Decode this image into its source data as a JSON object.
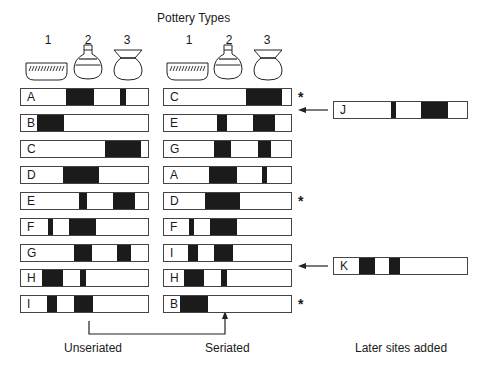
{
  "title": "Pottery Types",
  "pottery_types": [
    {
      "number": "1",
      "shape": "hatched-bowl"
    },
    {
      "number": "2",
      "shape": "narrow-neck-flask"
    },
    {
      "number": "3",
      "shape": "flared-rim-jar"
    }
  ],
  "unseriated": {
    "caption": "Unseriated",
    "bar_range_px": [
      20,
      149
    ],
    "rows": [
      {
        "label": "A",
        "fills": [
          [
            66,
            94
          ],
          [
            120,
            126
          ]
        ],
        "star": false
      },
      {
        "label": "B",
        "fills": [
          [
            37,
            64
          ]
        ],
        "star": false
      },
      {
        "label": "C",
        "fills": [
          [
            105,
            141
          ]
        ],
        "star": false
      },
      {
        "label": "D",
        "fills": [
          [
            63,
            99
          ]
        ],
        "star": false
      },
      {
        "label": "E",
        "fills": [
          [
            79,
            87
          ],
          [
            113,
            135
          ]
        ],
        "star": false
      },
      {
        "label": "F",
        "fills": [
          [
            48,
            53
          ],
          [
            69,
            96
          ]
        ],
        "star": false
      },
      {
        "label": "G",
        "fills": [
          [
            74,
            92
          ],
          [
            117,
            131
          ]
        ],
        "star": false
      },
      {
        "label": "H",
        "fills": [
          [
            42,
            63
          ],
          [
            80,
            86
          ]
        ],
        "star": false
      },
      {
        "label": "I",
        "fills": [
          [
            47,
            57
          ],
          [
            74,
            93
          ]
        ],
        "star": false
      }
    ]
  },
  "seriated": {
    "caption": "Seriated",
    "bar_range_px": [
      163,
      292
    ],
    "rows": [
      {
        "label": "C",
        "fills": [
          [
            246,
            282
          ]
        ],
        "star": true
      },
      {
        "label": "E",
        "fills": [
          [
            217,
            227
          ],
          [
            253,
            275
          ]
        ],
        "star": false
      },
      {
        "label": "G",
        "fills": [
          [
            214,
            231
          ],
          [
            258,
            271
          ]
        ],
        "star": false
      },
      {
        "label": "A",
        "fills": [
          [
            209,
            237
          ],
          [
            262,
            267
          ]
        ],
        "star": false
      },
      {
        "label": "D",
        "fills": [
          [
            205,
            240
          ]
        ],
        "star": true
      },
      {
        "label": "F",
        "fills": [
          [
            189,
            194
          ],
          [
            210,
            237
          ]
        ],
        "star": false
      },
      {
        "label": "I",
        "fills": [
          [
            188,
            198
          ],
          [
            214,
            233
          ]
        ],
        "star": false
      },
      {
        "label": "H",
        "fills": [
          [
            184,
            204
          ],
          [
            221,
            227
          ]
        ],
        "star": false
      },
      {
        "label": "B",
        "fills": [
          [
            180,
            208
          ]
        ],
        "star": true
      }
    ]
  },
  "later_sites": {
    "caption": "Later sites added",
    "bar_range_px": [
      333,
      468
    ],
    "sites": [
      {
        "label": "J",
        "insert_between": [
          "C",
          "E"
        ],
        "fills": [
          [
            391,
            396
          ],
          [
            421,
            448
          ]
        ]
      },
      {
        "label": "K",
        "insert_between": [
          "I",
          "H"
        ],
        "fills": [
          [
            359,
            375
          ],
          [
            389,
            400
          ]
        ]
      }
    ]
  },
  "star_symbol": "*",
  "colors": {
    "fill": "#1b1b1b",
    "outline": "#444444",
    "background": "#ffffff"
  }
}
